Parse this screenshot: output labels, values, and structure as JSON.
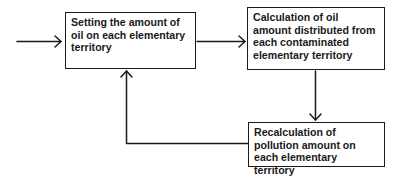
{
  "diagram": {
    "type": "flowchart",
    "nodes": [
      {
        "id": "set_oil",
        "label": "Setting the amount of oil on each elementary territory"
      },
      {
        "id": "calc_distributed",
        "label": "Calculation of oil amount distributed from each contaminated elementary territory"
      },
      {
        "id": "recalc_pollution",
        "label": "Recalculation of pollution amount on each elementary territory"
      }
    ],
    "edges": [
      {
        "from": "input",
        "to": "set_oil"
      },
      {
        "from": "set_oil",
        "to": "calc_distributed"
      },
      {
        "from": "calc_distributed",
        "to": "recalc_pollution"
      },
      {
        "from": "recalc_pollution",
        "to": "set_oil"
      }
    ],
    "colors": {
      "stroke": "#1a1a1a",
      "background": "#ffffff"
    }
  }
}
